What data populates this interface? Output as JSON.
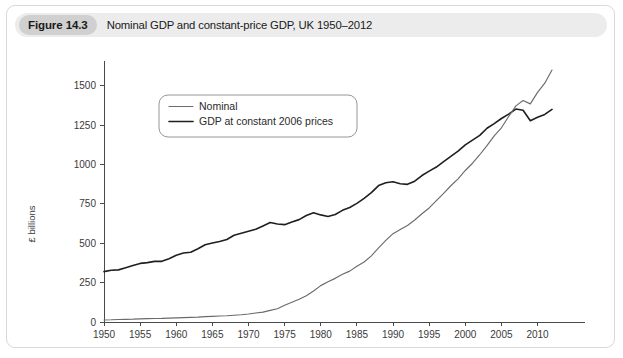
{
  "figure": {
    "label": "Figure 14.3",
    "title": "Nominal GDP and constant-price GDP, UK 1950–2012"
  },
  "chart_data": {
    "type": "line",
    "title": "Nominal GDP and constant-price GDP, UK 1950–2012",
    "xlabel": "",
    "ylabel": "£ billions",
    "xlim": [
      1950,
      2012
    ],
    "ylim": [
      0,
      1600
    ],
    "grid": false,
    "legend_position": "top-left",
    "xticks": [
      1950,
      1955,
      1960,
      1965,
      1970,
      1975,
      1980,
      1985,
      1990,
      1995,
      2000,
      2005,
      2010
    ],
    "yticks": [
      0,
      250,
      500,
      750,
      1000,
      1250,
      1500
    ],
    "x": [
      1950,
      1951,
      1952,
      1953,
      1954,
      1955,
      1956,
      1957,
      1958,
      1959,
      1960,
      1961,
      1962,
      1963,
      1964,
      1965,
      1966,
      1967,
      1968,
      1969,
      1970,
      1971,
      1972,
      1973,
      1974,
      1975,
      1976,
      1977,
      1978,
      1979,
      1980,
      1981,
      1982,
      1983,
      1984,
      1985,
      1986,
      1987,
      1988,
      1989,
      1990,
      1991,
      1992,
      1993,
      1994,
      1995,
      1996,
      1997,
      1998,
      1999,
      2000,
      2001,
      2002,
      2003,
      2004,
      2005,
      2006,
      2007,
      2008,
      2009,
      2010,
      2011,
      2012
    ],
    "series": [
      {
        "name": "Nominal",
        "color": "#6b6b6b",
        "values": [
          13,
          14,
          16,
          17,
          18,
          20,
          21,
          22,
          23,
          25,
          26,
          28,
          29,
          31,
          34,
          36,
          38,
          40,
          43,
          46,
          51,
          57,
          63,
          74,
          84,
          106,
          125,
          145,
          167,
          197,
          231,
          255,
          277,
          303,
          323,
          354,
          381,
          420,
          471,
          518,
          561,
          588,
          613,
          648,
          687,
          724,
          771,
          817,
          865,
          909,
          962,
          1008,
          1062,
          1120,
          1182,
          1233,
          1305,
          1372,
          1406,
          1385,
          1458,
          1516,
          1600
        ]
      },
      {
        "name": "GDP at constant 2006 prices",
        "color": "#1f1f1f",
        "values": [
          320,
          329,
          331,
          345,
          359,
          372,
          377,
          385,
          385,
          402,
          424,
          438,
          443,
          465,
          490,
          501,
          511,
          524,
          551,
          563,
          576,
          589,
          610,
          632,
          622,
          618,
          635,
          650,
          676,
          694,
          680,
          670,
          683,
          709,
          727,
          753,
          785,
          821,
          866,
          884,
          890,
          878,
          874,
          894,
          930,
          958,
          984,
          1018,
          1052,
          1085,
          1125,
          1155,
          1185,
          1230,
          1260,
          1292,
          1320,
          1352,
          1344,
          1278,
          1300,
          1318,
          1350
        ]
      }
    ]
  }
}
